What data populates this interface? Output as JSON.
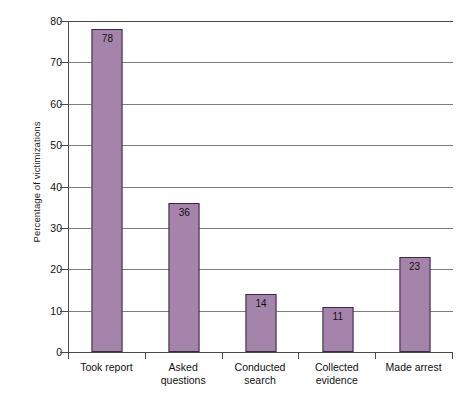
{
  "chart_data": {
    "type": "bar",
    "title": "",
    "subtitle": "",
    "xlabel": "",
    "ylabel": "Percentage of victimizations",
    "categories": [
      "Took report",
      "Asked questions",
      "Conducted search",
      "Collected evidence",
      "Made arrest"
    ],
    "category_lines": [
      [
        "Took report"
      ],
      [
        "Asked",
        "questions"
      ],
      [
        "Conducted",
        "search"
      ],
      [
        "Collected",
        "evidence"
      ],
      [
        "Made arrest"
      ]
    ],
    "values": [
      78,
      36,
      14,
      11,
      23
    ],
    "value_labels": [
      "78",
      "36",
      "14",
      "11",
      "23"
    ],
    "ylim": [
      0,
      80
    ],
    "yticks": [
      0,
      10,
      20,
      30,
      40,
      50,
      60,
      70,
      80
    ],
    "ytick_labels": [
      "0",
      "10",
      "20",
      "30",
      "40",
      "50",
      "60",
      "70",
      "80"
    ],
    "grid": true,
    "grid_axis": "y",
    "legend": false,
    "legend_position": "none",
    "colors": {
      "bar_fill": "#a584ac",
      "bar_stroke": "#3b2b40",
      "gridline": "#7d7d7d",
      "axis": "#4a4a4a",
      "text": "#111111",
      "background": "#ffffff"
    }
  }
}
